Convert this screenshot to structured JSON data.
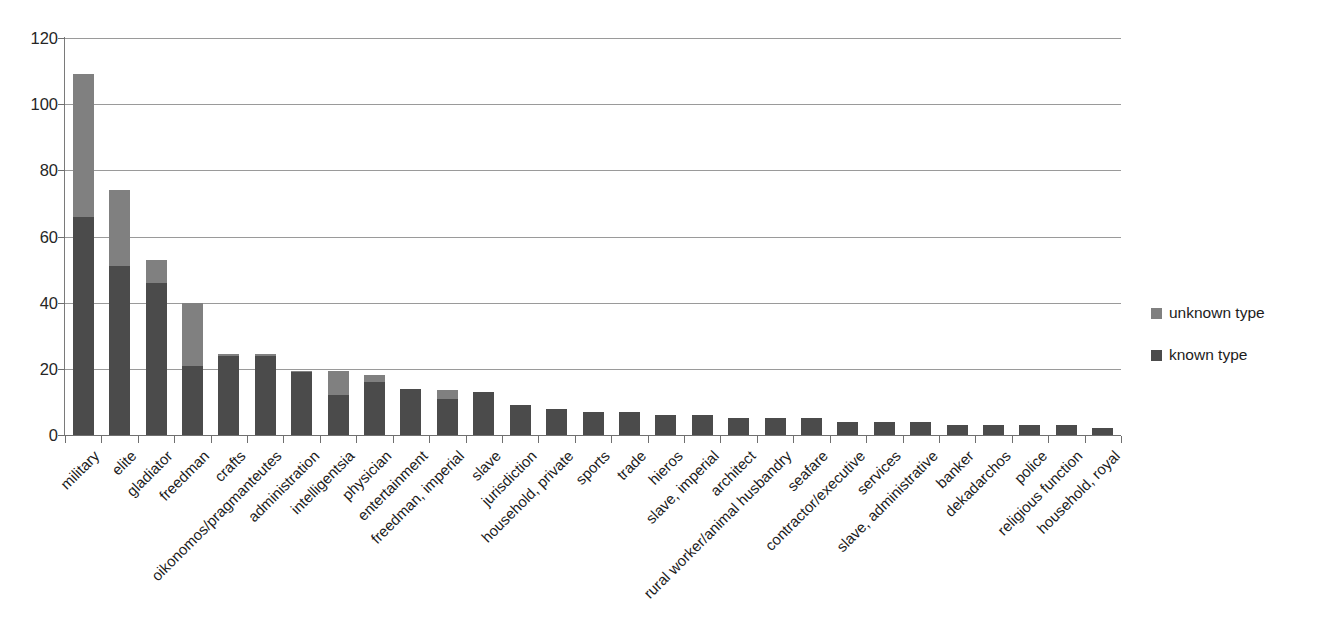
{
  "chart_data": {
    "type": "bar",
    "subtype": "stacked-bar",
    "title": "",
    "xlabel": "",
    "ylabel": "",
    "ylim": [
      0,
      120
    ],
    "y_ticks": [
      0,
      20,
      40,
      60,
      80,
      100,
      120
    ],
    "y_tick_labels": [
      "0",
      "20",
      "40",
      "60",
      "80",
      "100",
      "120"
    ],
    "grid": "horizontal",
    "legend_position": "right",
    "categories": [
      "military",
      "elite",
      "gladiator",
      "freedman",
      "crafts",
      "oikonomos/pragmanteutes",
      "administration",
      "intelligentsia",
      "physician",
      "entertainment",
      "freedman, imperial",
      "slave",
      "jurisdiction",
      "household, private",
      "sports",
      "trade",
      "hieros",
      "slave, imperial",
      "architect",
      "rural worker/animal husbandry",
      "seafare",
      "contractor/executive",
      "services",
      "slave, administrative",
      "banker",
      "dekadarchos",
      "police",
      "religious function",
      "household, royal"
    ],
    "series": [
      {
        "name": "known type",
        "color": "#4b4b4b",
        "values": [
          66,
          51,
          46,
          21,
          24,
          24,
          19,
          12,
          16,
          14,
          11,
          13,
          9,
          8,
          7,
          7,
          6,
          6,
          5,
          5,
          5,
          4,
          4,
          4,
          3,
          3,
          3,
          3,
          2
        ]
      },
      {
        "name": "unknown type",
        "color": "#808080",
        "values": [
          43,
          23,
          7,
          19,
          0.5,
          0.5,
          0.5,
          7.5,
          2,
          0,
          2.5,
          0,
          0,
          0,
          0,
          0,
          0,
          0,
          0,
          0,
          0,
          0,
          0,
          0,
          0,
          0,
          0,
          0,
          0
        ]
      }
    ],
    "totals": [
      109,
      74,
      53,
      40,
      24.5,
      24.5,
      19.5,
      19.5,
      18,
      14,
      13.5,
      13,
      9,
      8,
      7,
      7,
      6,
      6,
      5,
      5,
      5,
      4,
      4,
      4,
      3,
      3,
      3,
      3,
      2
    ]
  },
  "legend": {
    "items": [
      {
        "label": "unknown type",
        "color": "#808080"
      },
      {
        "label": "known type",
        "color": "#4b4b4b"
      }
    ]
  }
}
